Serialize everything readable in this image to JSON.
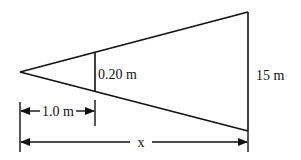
{
  "diagram": {
    "colors": {
      "stroke": "#111111",
      "background": "#ffffff"
    },
    "labels": {
      "small_height": "0.20 m",
      "large_height": "15 m",
      "small_distance": "1.0 m",
      "large_distance": "x"
    }
  }
}
